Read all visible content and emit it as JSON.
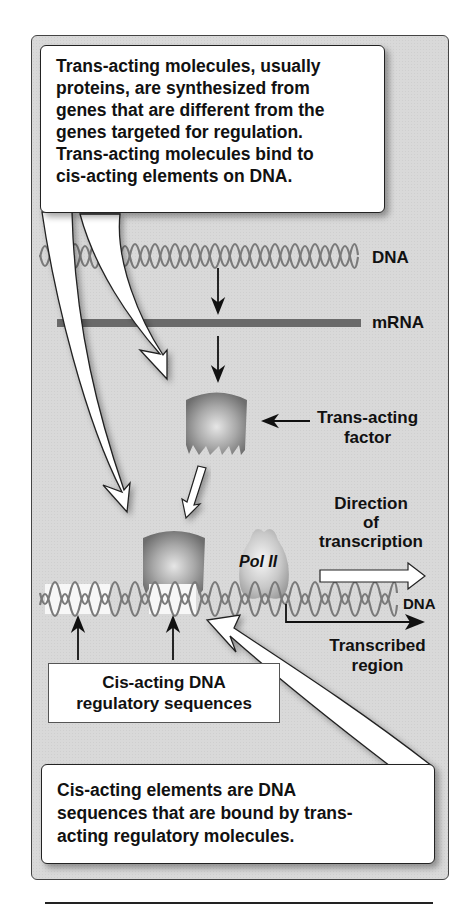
{
  "figure": {
    "top_callout": {
      "lines": [
        "Trans-acting molecules, usually",
        "proteins, are synthesized from",
        "genes that are different from the",
        "genes targeted for regulation.",
        "Trans-acting molecules bind to",
        "cis-acting elements on DNA."
      ]
    },
    "labels": {
      "dna_top": "DNA",
      "mrna": "mRNA",
      "trans_acting_factor_line1": "Trans-acting",
      "trans_acting_factor_line2": "factor",
      "direction_line1": "Direction",
      "direction_line2": "of",
      "direction_line3": "transcription",
      "dna_bottom": "DNA",
      "transcribed_line1": "Transcribed",
      "transcribed_line2": "region",
      "pol_ii": "Pol II"
    },
    "cis_box": {
      "line1": "Cis-acting DNA",
      "line2": "regulatory sequences"
    },
    "bottom_callout": {
      "lines": [
        "Cis-acting elements are DNA",
        "sequences that are bound by trans-",
        "acting regulatory molecules."
      ]
    },
    "colors": {
      "panel_bg": "#d9d9d9",
      "helix": "#7a7a7a",
      "mrna_bar": "#6a6a6a",
      "callout_bg": "#ffffff",
      "protein": "#8a8a8a"
    }
  }
}
